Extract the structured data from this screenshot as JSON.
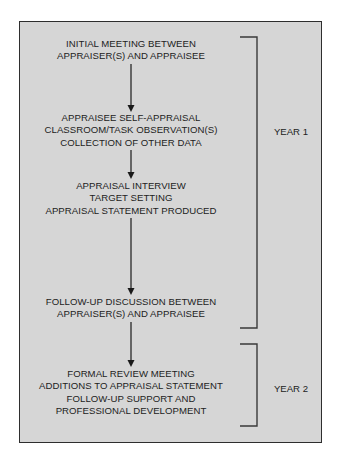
{
  "diagram": {
    "type": "flowchart",
    "steps": [
      {
        "lines": [
          "INITIAL MEETING BETWEEN",
          "APPRAISER(S) AND APPRAISEE"
        ]
      },
      {
        "lines": [
          "APPRAISEE SELF-APPRAISAL",
          "CLASSROOM/TASK OBSERVATION(S)",
          "COLLECTION OF OTHER DATA"
        ]
      },
      {
        "lines": [
          "APPRAISAL INTERVIEW",
          "TARGET SETTING",
          "APPRAISAL STATEMENT PRODUCED"
        ]
      },
      {
        "lines": [
          "FOLLOW-UP DISCUSSION BETWEEN",
          "APPRAISER(S) AND APPRAISEE"
        ]
      },
      {
        "lines": [
          "FORMAL REVIEW MEETING",
          "ADDITIONS TO APPRAISAL STATEMENT",
          "FOLLOW-UP SUPPORT AND",
          "PROFESSIONAL DEVELOPMENT"
        ]
      }
    ],
    "edges": [
      {
        "from": 0,
        "to": 1
      },
      {
        "from": 1,
        "to": 2
      },
      {
        "from": 2,
        "to": 3
      },
      {
        "from": 3,
        "to": 4
      }
    ],
    "phases": [
      {
        "label": "YEAR 1",
        "spans_steps": [
          0,
          1,
          2,
          3
        ]
      },
      {
        "label": "YEAR 2",
        "spans_steps": [
          4
        ]
      }
    ],
    "colors": {
      "frame_fill": "#d6d6d6",
      "frame_border": "#2e2e2e",
      "text": "#222222",
      "arrow": "#1a1a1a",
      "bracket": "#3a3a3a"
    }
  }
}
